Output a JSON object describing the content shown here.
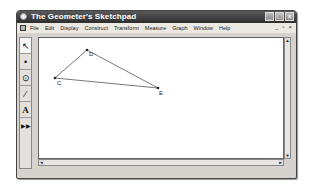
{
  "window": {
    "title": "The Geometer's Sketchpad",
    "title_buttons": [
      "minimize",
      "maximize",
      "close"
    ]
  },
  "menubar": {
    "items": [
      "File",
      "Edit",
      "Display",
      "Construct",
      "Transform",
      "Measure",
      "Graph",
      "Window",
      "Help"
    ],
    "mdi_buttons": [
      "_",
      "▫",
      "×"
    ]
  },
  "toolbox": {
    "tools": [
      {
        "name": "arrow-tool",
        "glyph": "↖"
      },
      {
        "name": "point-tool",
        "glyph": "•"
      },
      {
        "name": "compass-tool",
        "glyph": "⊙"
      },
      {
        "name": "straightedge-tool",
        "glyph": "⁄"
      },
      {
        "name": "text-tool",
        "glyph": "A"
      },
      {
        "name": "custom-tool",
        "glyph": "▶▶"
      }
    ]
  },
  "sketch": {
    "points": [
      {
        "label": "C",
        "x": 16,
        "y": 40
      },
      {
        "label": "D",
        "x": 48,
        "y": 12
      },
      {
        "label": "E",
        "x": 119,
        "y": 50
      }
    ],
    "segments": [
      [
        "C",
        "D"
      ],
      [
        "D",
        "E"
      ],
      [
        "C",
        "E"
      ]
    ]
  },
  "scrollbars": {
    "up": "▲",
    "down": "▼",
    "left": "◄",
    "right": "►"
  }
}
